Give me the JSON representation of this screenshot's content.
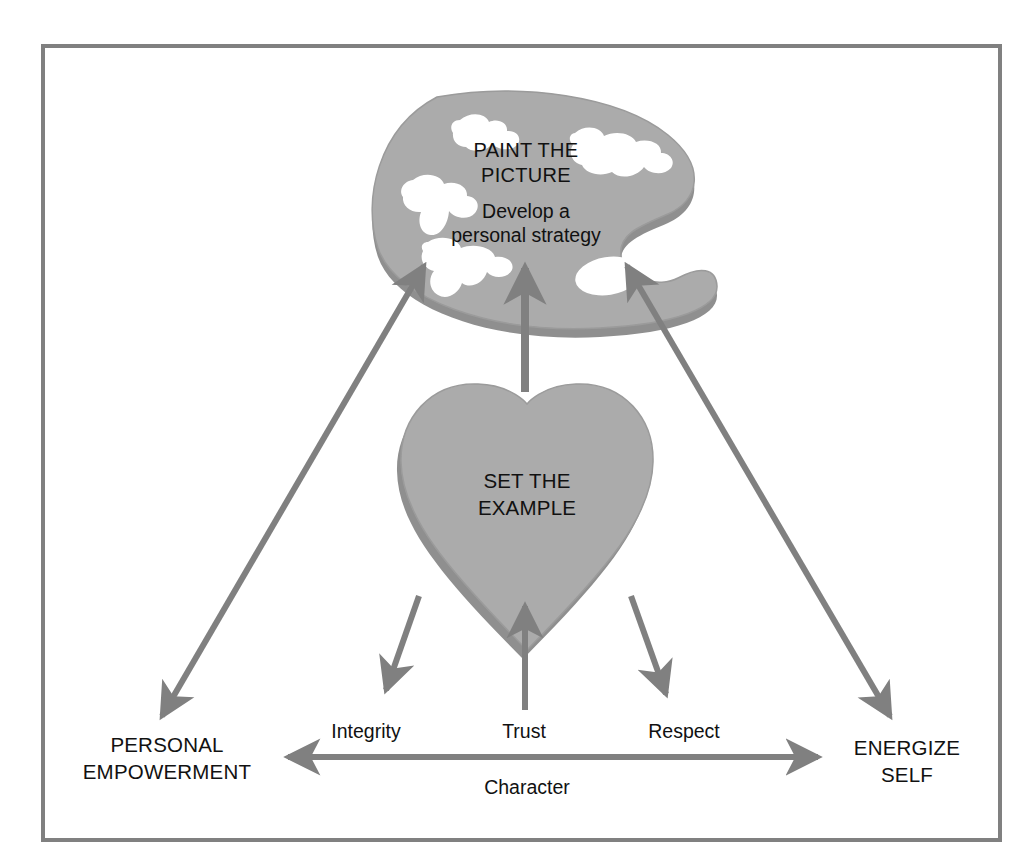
{
  "diagram": {
    "title_visible": false,
    "frame": {
      "border_color": "#808080",
      "background": "#ffffff"
    },
    "palette": {
      "heading_line1": "PAINT THE",
      "heading_line2": "PICTURE",
      "sub_line1": "Develop a",
      "sub_line2": "personal strategy",
      "fill_color": "#ababab",
      "edge_color": "#8f8f8f",
      "hole_color": "#ffffff",
      "icon_name": "artist-palette-shape"
    },
    "heart": {
      "heading_line1": "SET THE",
      "heading_line2": "EXAMPLE",
      "fill_color": "#ababab",
      "edge_color": "#8f8f8f",
      "icon_name": "heart-shape"
    },
    "nodes": [
      {
        "id": "personal-empowerment",
        "line1": "PERSONAL",
        "line2": "EMPOWERMENT"
      },
      {
        "id": "energize-self",
        "line1": "ENERGIZE",
        "line2": "SELF"
      }
    ],
    "values": [
      {
        "id": "integrity",
        "label": "Integrity"
      },
      {
        "id": "trust",
        "label": "Trust"
      },
      {
        "id": "respect",
        "label": "Respect"
      }
    ],
    "axis": {
      "label": "Character",
      "arrow_color": "#808080",
      "double_headed": true
    },
    "connectors": [
      {
        "id": "palette-to-empowerment",
        "double_headed": true
      },
      {
        "id": "palette-to-energize",
        "double_headed": true
      },
      {
        "id": "heart-to-palette",
        "double_headed": false
      },
      {
        "id": "integrity-from-heart",
        "double_headed": false
      },
      {
        "id": "trust-to-heart",
        "double_headed": false
      },
      {
        "id": "respect-from-heart",
        "double_headed": false
      }
    ],
    "colors": {
      "shape_fill": "#ababab",
      "shape_edge": "#8f8f8f",
      "arrow": "#808080",
      "text": "#111111",
      "frame": "#808080"
    }
  }
}
